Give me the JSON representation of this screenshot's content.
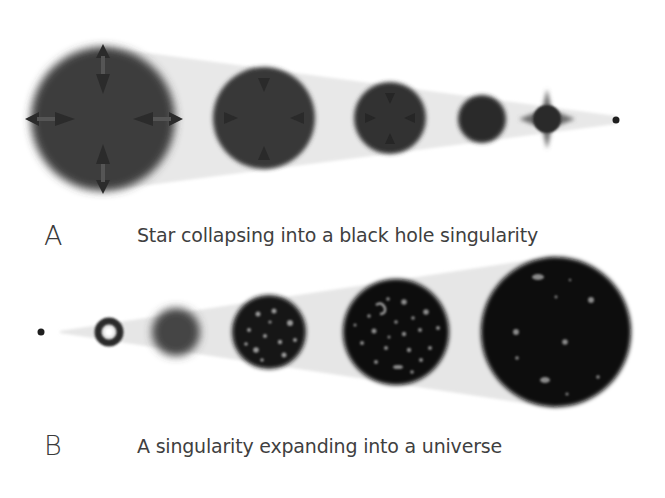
{
  "panel_a": {
    "letter": "A",
    "caption": "Star collapsing into a black hole singularity",
    "stages": [
      {
        "kind": "star-with-arrows",
        "cx": 103,
        "cy": 119,
        "r": 72
      },
      {
        "kind": "star-with-arrows",
        "cx": 264,
        "cy": 118,
        "r": 51
      },
      {
        "kind": "star-with-arrows",
        "cx": 390,
        "cy": 118,
        "r": 36
      },
      {
        "kind": "star",
        "cx": 482,
        "cy": 119,
        "r": 24
      },
      {
        "kind": "spiked-star",
        "cx": 547,
        "cy": 119,
        "r": 16
      },
      {
        "kind": "singularity-dot",
        "cx": 616,
        "cy": 120,
        "r": 3.5
      }
    ]
  },
  "panel_b": {
    "letter": "B",
    "caption": "A singularity expanding into a universe",
    "stages": [
      {
        "kind": "singularity-dot",
        "cx": 41,
        "cy": 332,
        "r": 3.5
      },
      {
        "kind": "ring",
        "cx": 109,
        "cy": 332,
        "r": 15
      },
      {
        "kind": "fuzzy-sphere",
        "cx": 176,
        "cy": 332,
        "r": 24
      },
      {
        "kind": "early-universe",
        "cx": 269,
        "cy": 332,
        "r": 37
      },
      {
        "kind": "galaxy-universe",
        "cx": 396,
        "cy": 332,
        "r": 53
      },
      {
        "kind": "mature-universe",
        "cx": 556,
        "cy": 332,
        "r": 75
      }
    ]
  },
  "colors": {
    "beam": "#e6e6e6",
    "star_a": "#3b3b3b",
    "star_dark": "#2a2a2a",
    "universe": "#0c0c0c",
    "text": "#3f3f3f"
  }
}
